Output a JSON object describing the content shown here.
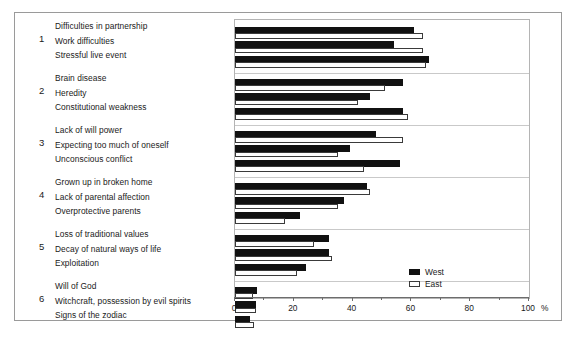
{
  "chart_data": {
    "type": "bar",
    "title": "",
    "subtitle": "",
    "xlabel": "100 %",
    "ylabel": "",
    "xlim": [
      0,
      100
    ],
    "grid": false,
    "orientation": "horizontal",
    "legend_position": "bottom-right",
    "axis": {
      "unit_label": "%",
      "ticks": [
        0,
        20,
        40,
        60,
        80,
        100
      ],
      "tick_labels": [
        "0",
        "20",
        "40",
        "60",
        "80",
        "100"
      ],
      "minor_tick_step": 10
    },
    "legend": [
      {
        "name": "West",
        "color": "#111111",
        "style": "filled"
      },
      {
        "name": "East",
        "color": "#ffffff",
        "style": "outlined"
      }
    ],
    "groups": [
      {
        "number": "1",
        "categories": [
          "Difficulties in partnership",
          "Work difficulties",
          "Stressful live event"
        ],
        "series": [
          {
            "name": "West",
            "values": [
              61,
              54,
              66
            ]
          },
          {
            "name": "East",
            "values": [
              64,
              64,
              65
            ]
          }
        ]
      },
      {
        "number": "2",
        "categories": [
          "Brain disease",
          "Heredity",
          "Constitutional weakness"
        ],
        "series": [
          {
            "name": "West",
            "values": [
              57,
              46,
              57
            ]
          },
          {
            "name": "East",
            "values": [
              51,
              42,
              59
            ]
          }
        ]
      },
      {
        "number": "3",
        "categories": [
          "Lack of will power",
          "Expecting too much of oneself",
          "Unconscious conflict"
        ],
        "series": [
          {
            "name": "West",
            "values": [
              48,
              39,
              56
            ]
          },
          {
            "name": "East",
            "values": [
              57,
              35,
              44
            ]
          }
        ]
      },
      {
        "number": "4",
        "categories": [
          "Grown up in broken home",
          "Lack of parental affection",
          "Overprotective parents"
        ],
        "series": [
          {
            "name": "West",
            "values": [
              45,
              37,
              22
            ]
          },
          {
            "name": "East",
            "values": [
              46,
              35,
              17
            ]
          }
        ]
      },
      {
        "number": "5",
        "categories": [
          "Loss of traditional values",
          "Decay of natural ways of life",
          "Exploitation"
        ],
        "series": [
          {
            "name": "West",
            "values": [
              32,
              32,
              24
            ]
          },
          {
            "name": "East",
            "values": [
              27,
              33,
              21
            ]
          }
        ]
      },
      {
        "number": "6",
        "categories": [
          "Will of God",
          "Witchcraft, possession by evil spirits",
          "Signs of the zodiac"
        ],
        "series": [
          {
            "name": "West",
            "values": [
              7.5,
              7,
              5
            ]
          },
          {
            "name": "East",
            "values": [
              6,
              7,
              6.5
            ]
          }
        ]
      }
    ]
  }
}
